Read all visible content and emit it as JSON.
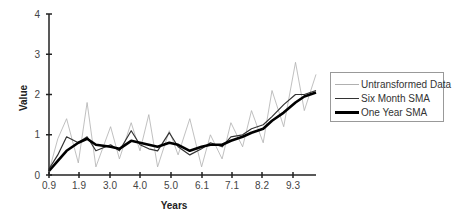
{
  "chart_data": {
    "type": "line",
    "title": "",
    "xlabel": "Years",
    "ylabel": "Value",
    "ylim": [
      0,
      4
    ],
    "xlim": [
      0.9,
      10.0
    ],
    "x_tick_labels": [
      "0.9",
      "1.9",
      "3.0",
      "4.0",
      "5.0",
      "6.1",
      "7.1",
      "8.2",
      "9.3"
    ],
    "y_tick_labels": [
      "0",
      "1",
      "2",
      "3",
      "4"
    ],
    "grid": false,
    "legend_position": "right",
    "x": [
      0.9,
      1.2,
      1.5,
      1.9,
      2.2,
      2.5,
      3.0,
      3.3,
      3.7,
      4.0,
      4.3,
      4.6,
      5.0,
      5.3,
      5.7,
      6.1,
      6.4,
      6.8,
      7.1,
      7.5,
      7.8,
      8.2,
      8.5,
      8.9,
      9.3,
      9.6,
      10.0
    ],
    "series": [
      {
        "name": "Untransformed Data",
        "color": "#b0b0b0",
        "width": 0.8,
        "values": [
          0.1,
          0.9,
          1.4,
          0.3,
          1.8,
          0.2,
          1.2,
          0.4,
          1.3,
          0.6,
          1.5,
          0.2,
          1.1,
          0.5,
          1.4,
          0.2,
          1.0,
          0.4,
          1.3,
          0.7,
          1.6,
          0.8,
          2.1,
          1.2,
          2.8,
          1.6,
          2.5
        ]
      },
      {
        "name": "Six Month SMA",
        "color": "#333333",
        "width": 1.2,
        "values": [
          0.15,
          0.5,
          0.95,
          0.8,
          0.95,
          0.6,
          0.75,
          0.6,
          1.1,
          0.75,
          0.65,
          0.6,
          1.05,
          0.7,
          0.5,
          0.65,
          0.8,
          0.7,
          0.95,
          1.0,
          1.15,
          1.25,
          1.45,
          1.75,
          2.0,
          2.0,
          2.1
        ]
      },
      {
        "name": "One Year SMA",
        "color": "#000000",
        "width": 2.6,
        "values": [
          0.1,
          0.35,
          0.6,
          0.8,
          0.9,
          0.75,
          0.7,
          0.65,
          0.85,
          0.8,
          0.75,
          0.7,
          0.8,
          0.75,
          0.6,
          0.7,
          0.75,
          0.75,
          0.85,
          0.95,
          1.05,
          1.15,
          1.35,
          1.55,
          1.8,
          1.95,
          2.05
        ]
      }
    ]
  },
  "legend": {
    "items": [
      {
        "label": "Untransformed Data"
      },
      {
        "label": "Six Month SMA"
      },
      {
        "label": "One Year SMA"
      }
    ]
  },
  "axes": {
    "x_title": "Years",
    "y_title": "Value"
  }
}
